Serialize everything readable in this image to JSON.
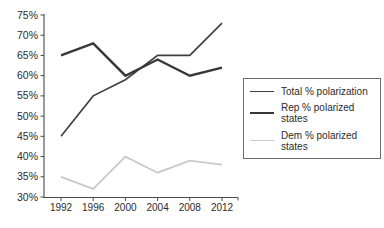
{
  "figure": {
    "background": "#ffffff",
    "axis_color": "#4a4a4a",
    "text_color": "#2b2b2b",
    "legend_border_color": "#6b6b6b"
  },
  "chart_data": {
    "type": "line",
    "title": "",
    "xlabel": "",
    "ylabel": "",
    "x": [
      1992,
      1996,
      2000,
      2004,
      2008,
      2012
    ],
    "x_tick_labels": [
      "1992",
      "1996",
      "2000",
      "2004",
      "2008",
      "2012"
    ],
    "y_ticks": [
      30,
      35,
      40,
      45,
      50,
      55,
      60,
      65,
      70,
      75
    ],
    "y_tick_labels": [
      "30%",
      "35%",
      "40%",
      "45%",
      "50%",
      "55%",
      "60%",
      "65%",
      "70%",
      "75%"
    ],
    "ylim": [
      30,
      75
    ],
    "grid": false,
    "legend_position": "right",
    "series": [
      {
        "name": "Total % polarization",
        "values": [
          45,
          55,
          59,
          65,
          65,
          73
        ],
        "color": "#3e3e3e",
        "stroke_width": 1.6
      },
      {
        "name": "Rep % polarized states",
        "values": [
          65,
          68,
          60,
          64,
          60,
          62
        ],
        "color": "#373737",
        "stroke_width": 2.4
      },
      {
        "name": "Dem % polarized states",
        "values": [
          35,
          32,
          40,
          36,
          39,
          38
        ],
        "color": "#c8cbc8",
        "stroke_width": 1.8
      }
    ]
  }
}
